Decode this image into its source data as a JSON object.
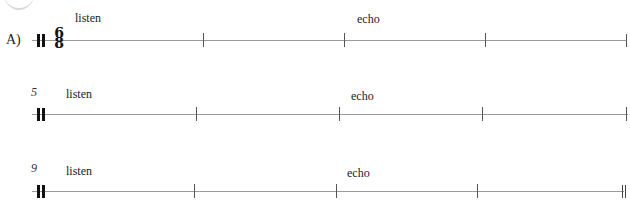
{
  "exercise": {
    "label": "A)",
    "time_signature": {
      "top": "6",
      "bottom": "8"
    },
    "systems": [
      {
        "measure_number": "",
        "words": [
          {
            "text": "listen"
          },
          {
            "text": "echo"
          }
        ]
      },
      {
        "measure_number": "5",
        "words": [
          {
            "text": "listen"
          },
          {
            "text": "echo"
          }
        ]
      },
      {
        "measure_number": "9",
        "words": [
          {
            "text": "listen"
          },
          {
            "text": "echo"
          }
        ]
      }
    ]
  },
  "colors": {
    "staff_line": "#9a9a9a",
    "barline": "#555555",
    "text": "#222222"
  }
}
